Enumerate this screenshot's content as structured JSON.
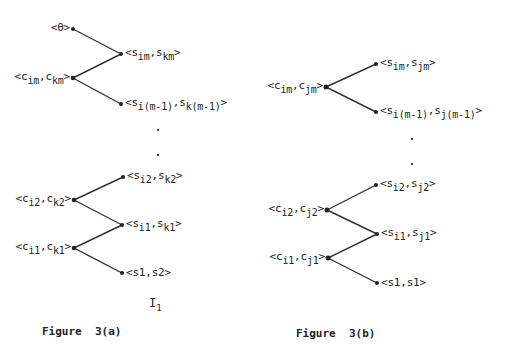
{
  "figure_a": {
    "caption": "Figure  3(a)",
    "tag_main": "I",
    "tag_sub": "1",
    "nodes": {
      "theta": {
        "label": "<θ>"
      },
      "c_m": {
        "pre": "<c",
        "s1": "im",
        "mid": ",c",
        "s2": "km",
        "post": ">"
      },
      "s_m": {
        "pre": "<s",
        "s1": "im",
        "mid": ",s",
        "s2": "km",
        "post": ">"
      },
      "s_m1": {
        "pre": "<s",
        "s1": "i(m-1)",
        "mid": ",s",
        "s2": "k(m-1)",
        "post": ">"
      },
      "s_2": {
        "pre": "<s",
        "s1": "i2",
        "mid": ",s",
        "s2": "k2",
        "post": ">"
      },
      "c_2": {
        "pre": "<c",
        "s1": "i2",
        "mid": ",c",
        "s2": "k2",
        "post": ">"
      },
      "s_1": {
        "pre": "<s",
        "s1": "i1",
        "mid": ",s",
        "s2": "k1",
        "post": ">"
      },
      "c_1": {
        "pre": "<c",
        "s1": "i1",
        "mid": ",c",
        "s2": "k1",
        "post": ">"
      },
      "leaf": {
        "label": "<s1,s2>"
      }
    }
  },
  "figure_b": {
    "caption": "Figure  3(b)",
    "nodes": {
      "c_m": {
        "pre": "<c",
        "s1": "im",
        "mid": ",c",
        "s2": "jm",
        "post": ">"
      },
      "s_m": {
        "pre": "<s",
        "s1": "im",
        "mid": ",s",
        "s2": "jm",
        "post": ">"
      },
      "s_m1": {
        "pre": "<s",
        "s1": "i(m-1)",
        "mid": ",s",
        "s2": "j(m-1)",
        "post": ">"
      },
      "s_2": {
        "pre": "<s",
        "s1": "i2",
        "mid": ",s",
        "s2": "j2",
        "post": ">"
      },
      "c_2": {
        "pre": "<c",
        "s1": "i2",
        "mid": ",c",
        "s2": "j2",
        "post": ">"
      },
      "s_1": {
        "pre": "<s",
        "s1": "i1",
        "mid": ",s",
        "s2": "j1",
        "post": ">"
      },
      "c_1": {
        "pre": "<c",
        "s1": "i1",
        "mid": ",c",
        "s2": "j1",
        "post": ">"
      },
      "leaf": {
        "label": "<s1,s1>"
      }
    }
  }
}
